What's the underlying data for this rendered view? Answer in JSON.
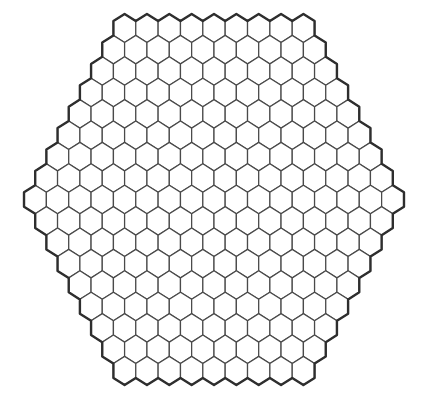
{
  "board": {
    "shape": "hexagon",
    "cell_shape": "pointy-top-hexagon",
    "side_length_cells": 9,
    "row_counts": [
      9,
      10,
      11,
      12,
      13,
      14,
      15,
      16,
      17,
      16,
      15,
      14,
      13,
      12,
      11,
      10,
      9
    ],
    "total_cells": 217,
    "colors": {
      "background": "#ffffff",
      "cell_fill": "#ffffff",
      "inner_stroke": "#4a4a4a",
      "outer_stroke": "#2e2e2e"
    }
  }
}
